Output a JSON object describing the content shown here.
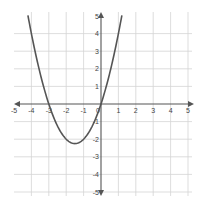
{
  "chart_data": {
    "type": "line",
    "title": "",
    "xlabel": "",
    "ylabel": "",
    "function": "y = x^2 + 3x",
    "xlim": [
      -5,
      5
    ],
    "ylim": [
      -5,
      5
    ],
    "grid": true,
    "legend": null,
    "x_ticks": [
      "-5",
      "-4",
      "-3",
      "-2",
      "-1",
      "0",
      "1",
      "2",
      "3",
      "4",
      "5"
    ],
    "y_ticks": [
      "5",
      "4",
      "3",
      "2",
      "1",
      "-1",
      "-2",
      "-3",
      "-4",
      "-5"
    ],
    "series": [
      {
        "name": "parabola",
        "color": "#555555",
        "x": [
          -4.2,
          -4,
          -3.5,
          -3,
          -2.5,
          -2,
          -1.5,
          -1,
          -0.5,
          0,
          0.5,
          1,
          1.2
        ],
        "y": [
          5.04,
          4,
          1.75,
          0,
          -1.25,
          -2,
          -2.25,
          -2,
          -1.25,
          0,
          1.75,
          4,
          5.04
        ]
      }
    ],
    "key_points": {
      "x_intercepts": [
        -3,
        0
      ],
      "vertex": [
        -1.5,
        -2.25
      ]
    }
  },
  "colors": {
    "grid": "#d4d4d4",
    "axis": "#555555",
    "curve": "#555555",
    "background": "#ffffff"
  }
}
